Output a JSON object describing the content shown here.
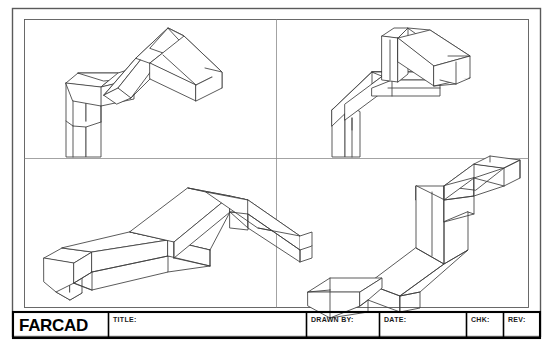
{
  "sheet": {
    "width": 552,
    "height": 345,
    "background": "#ffffff",
    "line_color": "#3a3a3a",
    "frame_color": "#555555",
    "title_block_color": "#000000"
  },
  "title_block": {
    "logo": "FARCAD",
    "fields": [
      {
        "key": "title",
        "label": "TITLE:"
      },
      {
        "key": "drawn_by",
        "label": "DRAWN  BY:"
      },
      {
        "key": "date",
        "label": "DATE:"
      },
      {
        "key": "chk",
        "label": "CHK:"
      },
      {
        "key": "rev",
        "label": "REV:"
      }
    ],
    "values": {
      "title": "",
      "drawn_by": "",
      "date": "",
      "chk": "",
      "rev": ""
    }
  },
  "views": [
    {
      "id": "view-top-left",
      "name": "isometric-view-1",
      "quadrant": "top-left"
    },
    {
      "id": "view-top-right",
      "name": "isometric-view-2",
      "quadrant": "top-right"
    },
    {
      "id": "view-bottom-left",
      "name": "isometric-view-3",
      "quadrant": "bottom-left"
    },
    {
      "id": "view-bottom-right",
      "name": "isometric-view-4",
      "quadrant": "bottom-right"
    }
  ]
}
